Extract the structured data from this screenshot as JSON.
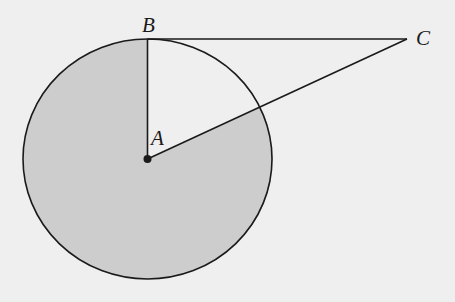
{
  "diagram": {
    "type": "geometry",
    "points": {
      "A": {
        "label": "A",
        "role": "center of circle"
      },
      "B": {
        "label": "B",
        "role": "point of tangency on circle"
      },
      "C": {
        "label": "C",
        "role": "external point"
      }
    },
    "segments": [
      "AB",
      "BC",
      "AC"
    ],
    "shaded_region": "major sector bounded by radius AB and segment AC",
    "colors": {
      "background": "#efefef",
      "shading": "#cdcdcd",
      "stroke": "#1a1a1a"
    }
  }
}
